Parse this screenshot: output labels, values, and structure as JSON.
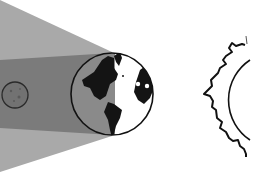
{
  "diagram": {
    "title": "Lunar eclipse: Moon inside Earth's shadow",
    "elements": [
      {
        "id": "penumbra",
        "label": "Penumbra",
        "color": "#a9a9a9"
      },
      {
        "id": "umbra",
        "label": "Umbra",
        "color": "#7a7a7a"
      },
      {
        "id": "moon",
        "label": "Moon",
        "color": "#6e6e6e"
      },
      {
        "id": "earth",
        "label": "Earth",
        "color": "#ffffff"
      },
      {
        "id": "sun",
        "label": "Sun",
        "color": "#ffffff"
      }
    ],
    "colors": {
      "background": "#ffffff",
      "penumbra": "#a9a9a9",
      "umbra": "#7a7a7a",
      "earth_night": "#8c8c8c",
      "continent": "#111111",
      "outline": "#111111"
    }
  }
}
